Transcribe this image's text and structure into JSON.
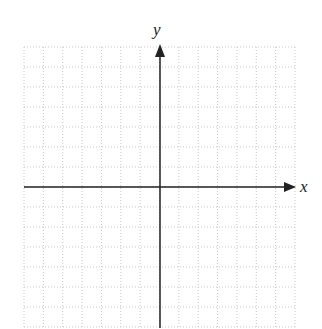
{
  "diagram": {
    "type": "coordinate-plane",
    "axes": {
      "x_label": "x",
      "y_label": "y"
    },
    "grid": {
      "columns": 14,
      "rows": 14,
      "style": "dotted",
      "line_color": "#c8c8c8",
      "axis_color": "#222222"
    }
  }
}
